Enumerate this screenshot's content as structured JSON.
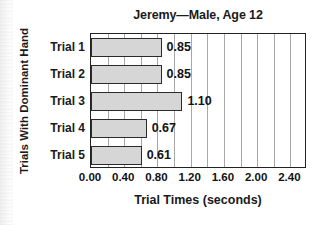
{
  "chart_data": {
    "type": "bar",
    "orientation": "horizontal",
    "title": "Jeremy—Male, Age 12",
    "xlabel": "Trial Times (seconds)",
    "ylabel": "Trials With Dominant Hand",
    "categories": [
      "Trial 1",
      "Trial 2",
      "Trial 3",
      "Trial 4",
      "Trial 5"
    ],
    "values": [
      0.85,
      0.85,
      1.1,
      0.67,
      0.61
    ],
    "value_labels": [
      "0.85",
      "0.85",
      "1.10",
      "0.67",
      "0.61"
    ],
    "xlim": [
      0.0,
      2.6
    ],
    "xticks": [
      0.0,
      0.4,
      0.8,
      1.2,
      1.6,
      2.0,
      2.4
    ],
    "xtick_labels": [
      "0.00",
      "0.40",
      "0.80",
      "1.20",
      "1.60",
      "2.00",
      "2.40"
    ],
    "gridlines": [
      0.2,
      0.4,
      0.6,
      0.8,
      1.0,
      1.2,
      1.4,
      1.6,
      1.8,
      2.0,
      2.2,
      2.4
    ],
    "grid": true,
    "grid_axis": "x",
    "legend": false,
    "bar_color": "#d6d6d6",
    "bar_edge_color": "#2b2b2b",
    "grid_color": "#a8a8a8",
    "axis_color": "#222222",
    "background_color": "#ffffff",
    "text_color": "#111111"
  }
}
